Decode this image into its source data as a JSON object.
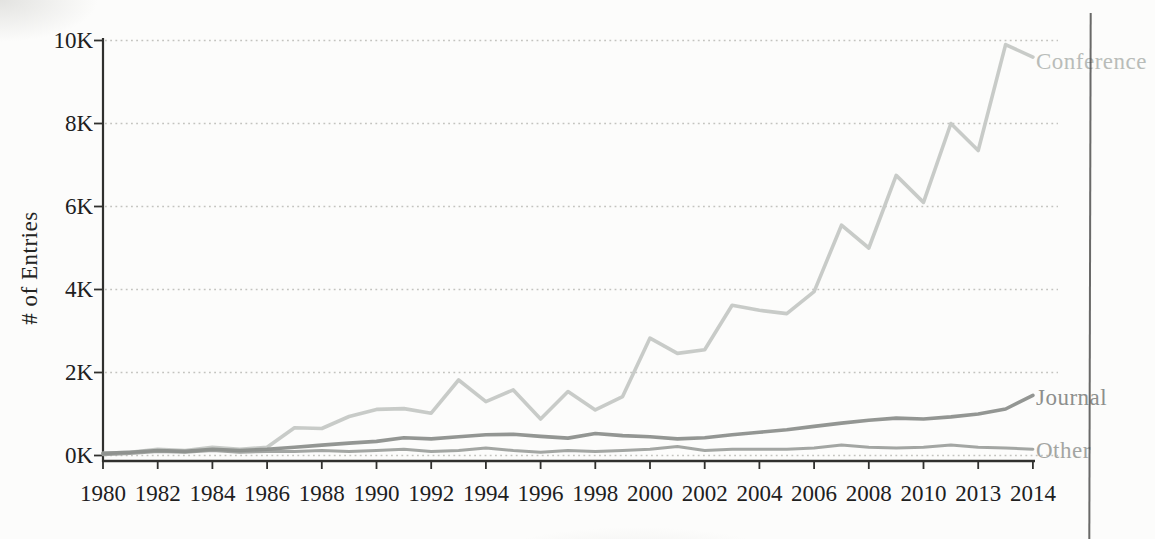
{
  "chart_data": {
    "type": "line",
    "title": "",
    "xlabel": "",
    "ylabel": "# of Entries",
    "unit": "thousands of entries",
    "ylim_k": [
      0,
      10
    ],
    "grid": "dotted horizontal gridlines at every 2K, y ticks every 2K",
    "legend_position": "inline labels at right end of each line",
    "y_tick_labels": [
      "0K",
      "2K",
      "4K",
      "6K",
      "8K",
      "10K"
    ],
    "x_tick_labels": [
      "1980",
      "1982",
      "1984",
      "1986",
      "1988",
      "1990",
      "1992",
      "1994",
      "1996",
      "1998",
      "2000",
      "2002",
      "2004",
      "2006",
      "2008",
      "2010",
      "2013",
      "2014"
    ],
    "years": [
      1980,
      1981,
      1982,
      1983,
      1984,
      1985,
      1986,
      1987,
      1988,
      1989,
      1990,
      1991,
      1992,
      1993,
      1994,
      1995,
      1996,
      1997,
      1998,
      1999,
      2000,
      2001,
      2002,
      2003,
      2004,
      2005,
      2006,
      2007,
      2008,
      2009,
      2010,
      2011,
      2012,
      2013,
      2014
    ],
    "series": [
      {
        "name": "Conference",
        "color": "#c5c8c5",
        "values_k": [
          0.05,
          0.08,
          0.15,
          0.12,
          0.2,
          0.15,
          0.2,
          0.67,
          0.65,
          0.94,
          1.11,
          1.13,
          1.02,
          1.82,
          1.3,
          1.58,
          0.88,
          1.54,
          1.1,
          1.42,
          2.83,
          2.46,
          2.55,
          3.62,
          3.5,
          3.42,
          3.95,
          5.55,
          5.0,
          6.75,
          6.1,
          8.0,
          7.35,
          9.9,
          9.6
        ]
      },
      {
        "name": "Journal",
        "color": "#8d908d",
        "values_k": [
          0.05,
          0.08,
          0.12,
          0.1,
          0.15,
          0.12,
          0.15,
          0.2,
          0.25,
          0.3,
          0.34,
          0.43,
          0.4,
          0.45,
          0.5,
          0.51,
          0.46,
          0.42,
          0.53,
          0.48,
          0.45,
          0.4,
          0.43,
          0.5,
          0.56,
          0.62,
          0.7,
          0.78,
          0.85,
          0.9,
          0.88,
          0.93,
          1.0,
          1.12,
          1.45
        ]
      },
      {
        "name": "Other",
        "color": "#9ea19e",
        "values_k": [
          0.02,
          0.05,
          0.1,
          0.08,
          0.12,
          0.08,
          0.1,
          0.1,
          0.12,
          0.1,
          0.12,
          0.15,
          0.1,
          0.12,
          0.18,
          0.12,
          0.08,
          0.12,
          0.1,
          0.12,
          0.15,
          0.22,
          0.12,
          0.15,
          0.15,
          0.15,
          0.18,
          0.25,
          0.2,
          0.18,
          0.2,
          0.25,
          0.2,
          0.18,
          0.15
        ]
      }
    ]
  },
  "labels": {
    "y_axis_title": "# of Entries",
    "series_end": {
      "conference": "Conference",
      "journal": "Journal",
      "other": "Other"
    }
  }
}
